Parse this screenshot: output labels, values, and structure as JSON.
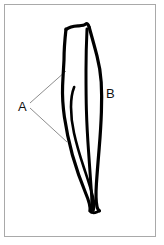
{
  "figure": {
    "kind": "line-drawing",
    "caption": "",
    "background_color": "#ffffff",
    "ink_color": "#000000",
    "frame": {
      "border_color": "#a9a9a9",
      "border_width_px": 1,
      "x": 4,
      "y": 4,
      "width": 152,
      "height": 233
    },
    "subject": {
      "name": "long-bone-pair-outline",
      "description": "Hand-drawn outline of a pair of long bones (shaft view), wide and squared at the top, tapering and crossing to a point at the bottom."
    },
    "labels": [
      {
        "id": "A",
        "text": "A",
        "x": 18,
        "y": 111,
        "leader_color": "#808080",
        "leaders": [
          {
            "x1": 30,
            "y1": 103,
            "x2": 66,
            "y2": 71
          },
          {
            "x1": 30,
            "y1": 108,
            "x2": 67,
            "y2": 142
          }
        ]
      },
      {
        "id": "B",
        "text": "B",
        "x": 106,
        "y": 98,
        "leader_color": "#808080",
        "leaders": []
      }
    ],
    "strokes": {
      "outer_left_edge": "M 66,29 L 65,44 L 64,57 L 64,66 L 63,74 L 63,84 L 62,94 L 63,105 L 64,116 L 66,128 L 69,142 L 73,156 L 78,170 L 83,183 L 88,195 L 91,205 L 90,211",
      "top_edge": "M 66,29 L 74,26 L 82,26 L 86,24 L 89,27",
      "inner_left_edge": "M 73,88 L 71,97 L 71,107 L 72,118 L 74,130 L 77,143 L 81,157 L 85,170 L 89,182 L 92,193 L 94,203 L 93,210",
      "inner_right_edge": "M 86,30 L 86,45 L 86,60 L 86,75 L 86,90 L 86,105 L 87,120 L 88,135 L 89,150 L 90,165 L 91,180 L 92,193 L 92,205 L 91,212",
      "outer_right_edge": "M 89,27 L 92,40 L 95,52 L 98,63 L 100,74 L 101,86 L 101,98 L 101,110 L 101,122 L 100,134 L 99,146 L 98,158 L 97,170 L 96,182 L 96,194 L 97,204 L 99,210"
    }
  }
}
